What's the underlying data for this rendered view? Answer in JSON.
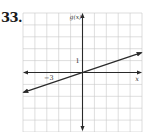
{
  "problem": {
    "number": "33."
  },
  "chart_data": {
    "type": "line",
    "title": "",
    "xlabel": "x",
    "ylabel": "g(x)",
    "xlim": [
      -5,
      5
    ],
    "ylim": [
      -5,
      5
    ],
    "grid": true,
    "tick_labels": {
      "x": [
        {
          "value": -3,
          "label": "−3"
        }
      ],
      "y": [
        {
          "value": 1,
          "label": "1"
        }
      ]
    },
    "series": [
      {
        "name": "g(x)",
        "equation": "g(x) = (1/3)x",
        "slope": 0.3333,
        "intercept": 0,
        "x": [
          -5,
          -3,
          0,
          3,
          5
        ],
        "y": [
          -1.667,
          -1,
          0,
          1,
          1.667
        ],
        "arrows": "both"
      }
    ],
    "colors": {
      "grid": "#c8c8c8",
      "axis": "#2a2a2a",
      "line": "#2a2a2a"
    }
  }
}
